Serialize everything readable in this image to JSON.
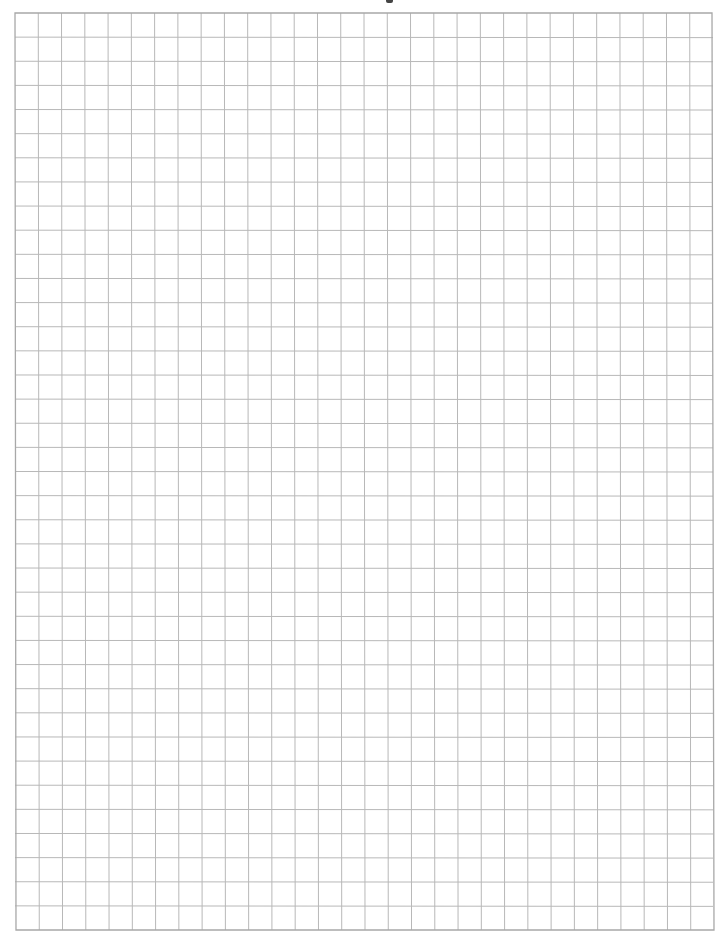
{
  "document": {
    "type": "graph-paper",
    "background_color": "#ffffff",
    "line_color": "#b8b8b8",
    "border_color": "#a8a8a8",
    "grid": {
      "columns": 30,
      "rows": 38,
      "left": 15,
      "top": 13,
      "right": 713,
      "bottom": 930
    }
  }
}
